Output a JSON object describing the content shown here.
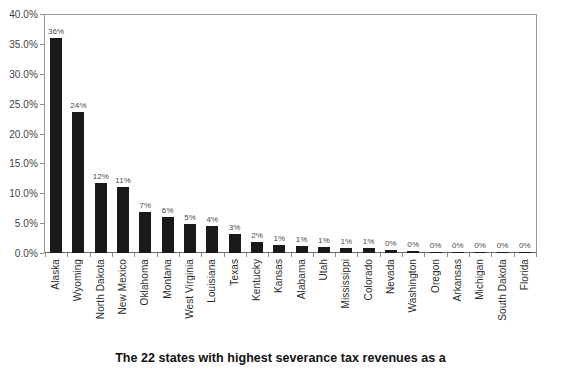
{
  "caption": "The 22 states with highest severance tax revenues as a",
  "chart_data": {
    "type": "bar",
    "title": "",
    "subtitle": "",
    "xlabel": "",
    "ylabel": "",
    "ylim": [
      0,
      40
    ],
    "grid": false,
    "legend": "none",
    "bar_color": "#1a1a1a",
    "axis_color": "#8f8f8f",
    "y_ticks": [
      "0.0%",
      "5.0%",
      "10.0%",
      "15.0%",
      "20.0%",
      "25.0%",
      "30.0%",
      "35.0%",
      "40.0%"
    ],
    "y_tick_values": [
      0,
      5,
      10,
      15,
      20,
      25,
      30,
      35,
      40
    ],
    "categories": [
      "Alaska",
      "Wyoming",
      "North Dakota",
      "New Mexico",
      "Oklahoma",
      "Montana",
      "West Virginia",
      "Louisiana",
      "Texas",
      "Kentucky",
      "Kansas",
      "Alabama",
      "Utah",
      "Mississippi",
      "Colorado",
      "Nevada",
      "Washington",
      "Oregon",
      "Arkansas",
      "Michigan",
      "South Dakota",
      "Florida"
    ],
    "values": [
      36.0,
      23.6,
      11.7,
      11.0,
      6.9,
      6.0,
      4.9,
      4.5,
      3.1,
      1.9,
      1.3,
      1.2,
      1.0,
      0.9,
      0.8,
      0.45,
      0.3,
      0.25,
      0.22,
      0.2,
      0.18,
      0.15
    ],
    "data_labels": [
      "36%",
      "24%",
      "12%",
      "11%",
      "7%",
      "6%",
      "5%",
      "4%",
      "3%",
      "2%",
      "1%",
      "1%",
      "1%",
      "1%",
      "1%",
      "0%",
      "0%",
      "0%",
      "0%",
      "0%",
      "0%",
      "0%"
    ]
  }
}
